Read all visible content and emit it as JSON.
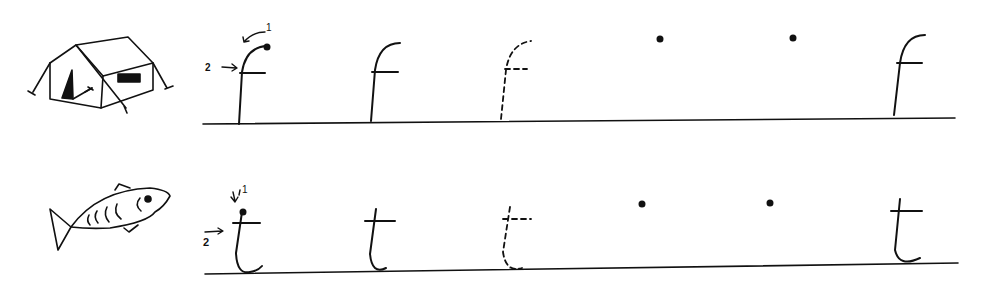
{
  "worksheet": {
    "type": "handwriting-practice",
    "rows": [
      {
        "letter": "f",
        "picture": "tent",
        "stroke_labels": [
          "1",
          "2"
        ],
        "practice": [
          "model-with-arrows",
          "solid",
          "dashed-trace",
          "start-dot",
          "start-dot",
          "solid"
        ]
      },
      {
        "letter": "t",
        "picture": "fish",
        "stroke_labels": [
          "1",
          "2"
        ],
        "practice": [
          "model-with-arrows",
          "solid",
          "dashed-trace",
          "start-dot",
          "start-dot",
          "solid"
        ]
      }
    ]
  },
  "colors": {
    "ink": "#111111",
    "background": "#ffffff"
  }
}
